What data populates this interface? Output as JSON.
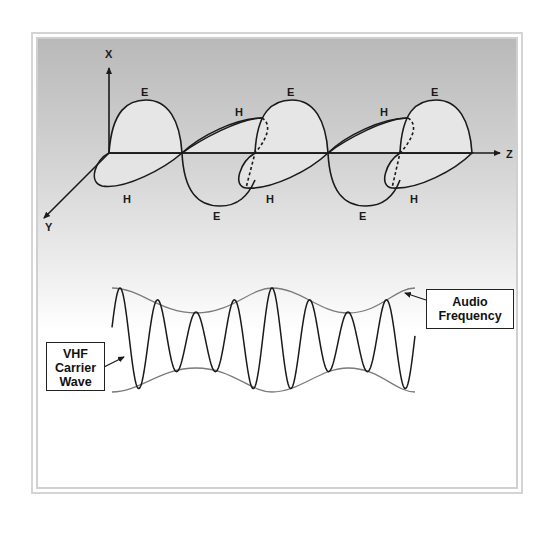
{
  "figure": {
    "top_diagram": {
      "title": "Electromagnetic wave propagation",
      "axes": {
        "x_label": "X",
        "y_label": "Y",
        "z_label": "Z"
      },
      "field_labels": {
        "e_labels": [
          "E",
          "E",
          "E",
          "E",
          "E"
        ],
        "h_labels": [
          "H",
          "H",
          "H",
          "H",
          "H"
        ]
      }
    },
    "bottom_diagram": {
      "title": "Amplitude modulated carrier",
      "carrier_callout": {
        "line1": "VHF",
        "line2": "Carrier",
        "line3": "Wave"
      },
      "envelope_callout": {
        "line1": "Audio",
        "line2": "Frequency"
      }
    }
  },
  "colors": {
    "line": "#1a1a1a",
    "envelope": "#7a7a7a",
    "lobe_fill": "#e3e3e3",
    "bg_top": "#b9b9b9",
    "bg_bottom": "#ffffff"
  }
}
